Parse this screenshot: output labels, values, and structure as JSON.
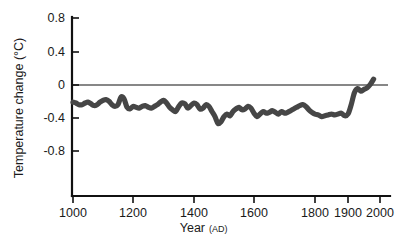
{
  "chart_data": {
    "type": "line",
    "title": "",
    "subtitle": "",
    "xlabel": "Year",
    "xlabel_suffix": "(AD)",
    "ylabel": "Temperature change (°C)",
    "xlim": [
      1000,
      2000
    ],
    "ylim": [
      -1.0,
      0.8
    ],
    "grid": false,
    "legend": null,
    "legend_position": "none",
    "x_tick_labels": [
      "1000",
      "1200",
      "1400",
      "1600",
      "1800",
      "1900",
      "2000"
    ],
    "x_tick_values": [
      1000,
      1200,
      1400,
      1600,
      1800,
      1900,
      2000
    ],
    "x_axis_scale_note": "non-uniform: 1000-1800 compressed evenly, 1800-2000 expanded",
    "y_tick_labels": [
      "0.8",
      "0.4",
      "0",
      "-0.4",
      "-0.8"
    ],
    "y_tick_values": [
      0.8,
      0.4,
      0,
      -0.4,
      -0.8
    ],
    "reference_line": {
      "name": "zero-reference",
      "value": 0,
      "orientation": "horizontal"
    },
    "series": [
      {
        "name": "Reconstructed temperature anomaly",
        "color": "#464646",
        "x": [
          1000,
          1010,
          1020,
          1030,
          1040,
          1050,
          1060,
          1070,
          1080,
          1090,
          1100,
          1110,
          1120,
          1130,
          1140,
          1150,
          1160,
          1170,
          1180,
          1190,
          1200,
          1210,
          1220,
          1230,
          1240,
          1250,
          1260,
          1270,
          1280,
          1290,
          1300,
          1310,
          1320,
          1330,
          1340,
          1350,
          1360,
          1370,
          1380,
          1390,
          1400,
          1410,
          1420,
          1430,
          1440,
          1450,
          1460,
          1470,
          1480,
          1490,
          1500,
          1510,
          1520,
          1530,
          1540,
          1550,
          1560,
          1570,
          1580,
          1590,
          1600,
          1610,
          1620,
          1630,
          1640,
          1650,
          1660,
          1670,
          1680,
          1690,
          1700,
          1710,
          1720,
          1730,
          1740,
          1750,
          1760,
          1770,
          1780,
          1790,
          1800,
          1810,
          1820,
          1830,
          1840,
          1850,
          1860,
          1870,
          1880,
          1890,
          1900,
          1910,
          1920,
          1930,
          1940,
          1950,
          1960,
          1970,
          1980
        ],
        "y": [
          -0.19,
          -0.2,
          -0.22,
          -0.22,
          -0.2,
          -0.19,
          -0.21,
          -0.23,
          -0.22,
          -0.19,
          -0.17,
          -0.16,
          -0.18,
          -0.22,
          -0.24,
          -0.22,
          -0.13,
          -0.15,
          -0.25,
          -0.27,
          -0.24,
          -0.25,
          -0.26,
          -0.24,
          -0.23,
          -0.25,
          -0.26,
          -0.24,
          -0.22,
          -0.19,
          -0.17,
          -0.2,
          -0.25,
          -0.28,
          -0.3,
          -0.24,
          -0.2,
          -0.21,
          -0.26,
          -0.23,
          -0.2,
          -0.22,
          -0.27,
          -0.26,
          -0.22,
          -0.24,
          -0.3,
          -0.36,
          -0.44,
          -0.42,
          -0.36,
          -0.33,
          -0.35,
          -0.3,
          -0.27,
          -0.25,
          -0.28,
          -0.27,
          -0.24,
          -0.26,
          -0.32,
          -0.36,
          -0.33,
          -0.3,
          -0.32,
          -0.31,
          -0.29,
          -0.31,
          -0.33,
          -0.3,
          -0.32,
          -0.31,
          -0.29,
          -0.27,
          -0.25,
          -0.23,
          -0.22,
          -0.24,
          -0.28,
          -0.31,
          -0.33,
          -0.34,
          -0.36,
          -0.35,
          -0.34,
          -0.33,
          -0.34,
          -0.33,
          -0.32,
          -0.35,
          -0.33,
          -0.22,
          -0.08,
          -0.03,
          -0.06,
          -0.04,
          -0.02,
          0.02,
          0.08
        ]
      }
    ]
  },
  "figure": {
    "background_color": "#ffffff",
    "axis_color": "#111111"
  }
}
